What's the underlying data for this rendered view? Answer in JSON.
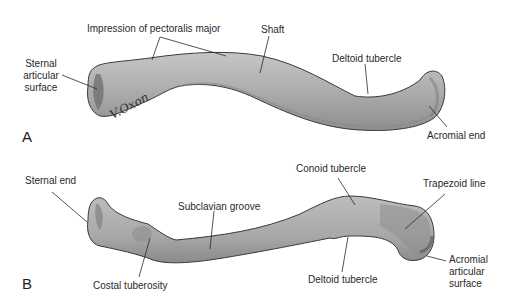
{
  "figure": {
    "panels": [
      {
        "letter": "A",
        "labels": {
          "impression": "Impression of pectoralis major",
          "shaft": "Shaft",
          "sternal_surface_1": "Sternal",
          "sternal_surface_2": "articular",
          "sternal_surface_3": "surface",
          "deltoid": "Deltoid tubercle",
          "acromial_end": "Acromial end"
        },
        "signature": "V.Oxon"
      },
      {
        "letter": "B",
        "labels": {
          "sternal_end": "Sternal end",
          "subclavian": "Subclavian groove",
          "conoid": "Conoid tubercle",
          "trapezoid": "Trapezoid line",
          "costal": "Costal tuberosity",
          "deltoid": "Deltoid tubercle",
          "acromial_surface_1": "Acromial",
          "acromial_surface_2": "articular",
          "acromial_surface_3": "surface"
        }
      }
    ],
    "colors": {
      "bone_fill": "#a9a9a9",
      "bone_light": "#c4c4c4",
      "bone_dark": "#7d7d7d",
      "outline": "#3a3a3a",
      "leader": "#2a2a2a",
      "background": "#ffffff"
    }
  }
}
